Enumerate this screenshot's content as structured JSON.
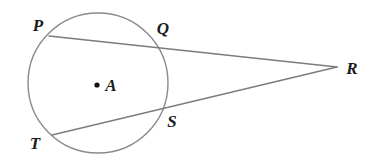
{
  "figure": {
    "background_color": "#ffffff",
    "stroke_color": "#8a8a8a",
    "label_color": "#1b1b1b",
    "dot_color": "#111111",
    "width": 385,
    "height": 166
  },
  "circle": {
    "center_label": "A",
    "center_x": 98,
    "center_y": 83,
    "radius": 70
  },
  "points": {
    "P": {
      "label": "P",
      "x": 49,
      "y": 36,
      "label_x": 38,
      "label_y": 25
    },
    "Q": {
      "label": "Q",
      "x": 157,
      "y": 48,
      "label_x": 163,
      "label_y": 28
    },
    "R": {
      "label": "R",
      "x": 337,
      "y": 67,
      "label_x": 352,
      "label_y": 68
    },
    "S": {
      "label": "S",
      "x": 161,
      "y": 112,
      "label_x": 172,
      "label_y": 121
    },
    "T": {
      "label": "T",
      "x": 52,
      "y": 135,
      "label_x": 35,
      "label_y": 143
    },
    "A": {
      "label": "A",
      "x": 97,
      "y": 85,
      "label_x": 111,
      "label_y": 85
    }
  },
  "segments": [
    {
      "name": "secant-PR",
      "from": "P",
      "to": "R",
      "x1": 49,
      "y1": 36,
      "x2": 337,
      "y2": 67
    },
    {
      "name": "secant-TR",
      "from": "T",
      "to": "R",
      "x1": 52,
      "y1": 135,
      "x2": 337,
      "y2": 67
    }
  ]
}
